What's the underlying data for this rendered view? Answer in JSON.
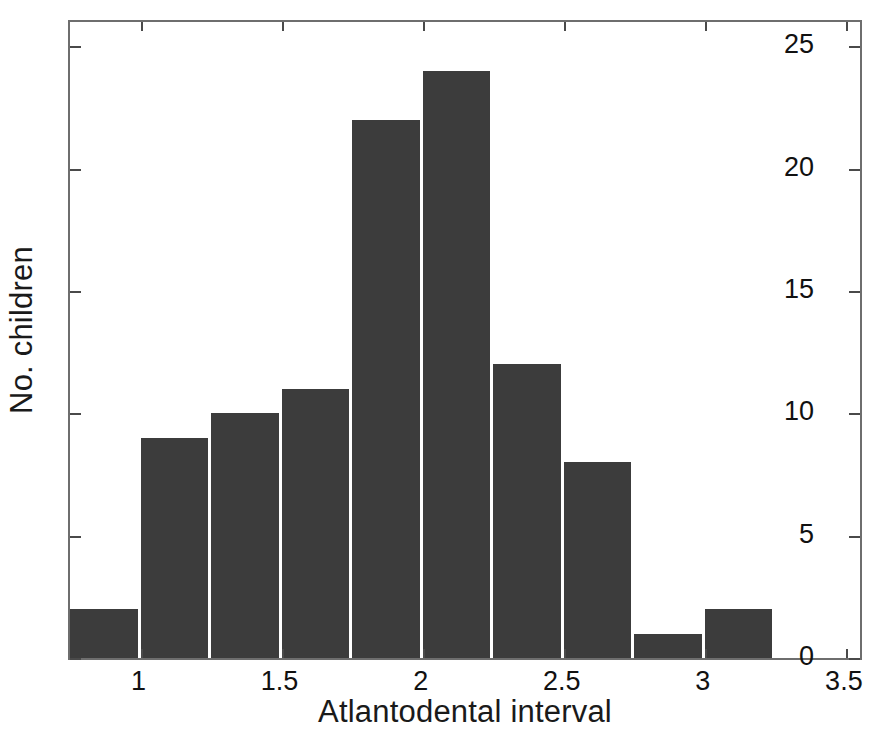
{
  "chart_data": {
    "type": "bar",
    "title": "",
    "subtitle": "",
    "xlabel": "Atlantodental interval",
    "ylabel": "No. children",
    "categories": [
      "0.875",
      "1.125",
      "1.375",
      "1.625",
      "1.875",
      "2.125",
      "2.375",
      "2.625",
      "2.875",
      "3.125"
    ],
    "x": [
      0.875,
      1.125,
      1.375,
      1.625,
      1.875,
      2.125,
      2.375,
      2.625,
      2.875,
      3.125
    ],
    "values": [
      2,
      9,
      10,
      11,
      22,
      24,
      12,
      8,
      1,
      2
    ],
    "bin_width": 0.25,
    "xlim": [
      0.75,
      3.55
    ],
    "ylim": [
      0,
      26
    ],
    "xticks": [
      1,
      1.5,
      2,
      2.5,
      3,
      3.5
    ],
    "xtick_labels": [
      "1",
      "1.5",
      "2",
      "2.5",
      "3",
      "3.5"
    ],
    "yticks": [
      0,
      5,
      10,
      15,
      20,
      25
    ],
    "ytick_labels": [
      "0",
      "5",
      "10",
      "15",
      "20",
      "25"
    ],
    "grid": false,
    "legend": null,
    "legend_position": "none",
    "bar_color": "#3c3c3c",
    "axis_color": "#6e6e6e",
    "background_color": "#ffffff",
    "annotations": []
  }
}
